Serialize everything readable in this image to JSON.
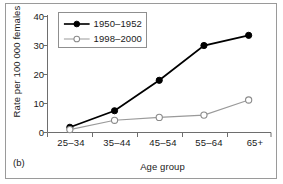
{
  "panel_label": "(b)",
  "chart_data": {
    "type": "line",
    "title": "",
    "xlabel": "Age group",
    "ylabel": "Rate per 100 000 females",
    "categories": [
      "25–34",
      "35–44",
      "45–54",
      "55–64",
      "65+"
    ],
    "series": [
      {
        "name": "1950–1952",
        "values": [
          1.8,
          7.5,
          18.0,
          30.0,
          33.5
        ],
        "color": "#000000",
        "marker": "filled-circle",
        "line_width": 1.8
      },
      {
        "name": "1998–2000",
        "values": [
          1.0,
          4.2,
          5.2,
          6.0,
          11.2
        ],
        "color": "#9a9a9a",
        "marker": "open-circle",
        "line_width": 1.1
      }
    ],
    "ylim": [
      0,
      40
    ],
    "yticks": [
      0,
      10,
      20,
      30,
      40
    ],
    "ytick_labels": [
      "0",
      "10",
      "20",
      "30",
      "40"
    ],
    "grid": false,
    "legend_position": "top-left"
  }
}
